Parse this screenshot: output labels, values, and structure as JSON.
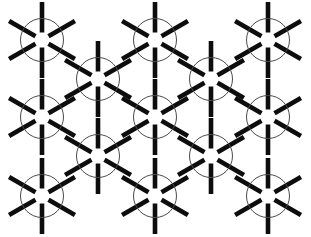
{
  "figure": {
    "type": "line-art-diagram",
    "width": 311,
    "height": 237,
    "background_color": "#ffffff"
  },
  "style": {
    "spoke_color": "#0d0d0d",
    "spoke_width": 4.6,
    "circle_stroke_color": "#4a4a4a",
    "circle_stroke_width": 1.0,
    "circle_radius": 21.5,
    "spoke_inner_radius": 7.5,
    "spoke_outer_radius": 38,
    "spoke_count": 6,
    "spoke_angles_deg": [
      90,
      150,
      210,
      270,
      330,
      30
    ]
  },
  "lattice": {
    "description": "Staggered triangular lattice; odd rows at x offsets 42/155/268, even rows at 98/211",
    "column_spacing": 113,
    "row_spacing": 38.8,
    "row_offset": 56.5,
    "row_count": 5,
    "node_count": 13,
    "nodes": [
      {
        "id": "n1",
        "row": 1,
        "col": 1,
        "cx": 42,
        "cy": 40
      },
      {
        "id": "n2",
        "row": 1,
        "col": 2,
        "cx": 155,
        "cy": 40
      },
      {
        "id": "n3",
        "row": 1,
        "col": 3,
        "cx": 268,
        "cy": 40
      },
      {
        "id": "n4",
        "row": 2,
        "col": 1,
        "cx": 98,
        "cy": 79
      },
      {
        "id": "n5",
        "row": 2,
        "col": 2,
        "cx": 211,
        "cy": 79
      },
      {
        "id": "n6",
        "row": 3,
        "col": 1,
        "cx": 42,
        "cy": 117
      },
      {
        "id": "n7",
        "row": 3,
        "col": 2,
        "cx": 155,
        "cy": 117
      },
      {
        "id": "n8",
        "row": 3,
        "col": 3,
        "cx": 268,
        "cy": 117
      },
      {
        "id": "n9",
        "row": 4,
        "col": 1,
        "cx": 98,
        "cy": 156
      },
      {
        "id": "n10",
        "row": 4,
        "col": 2,
        "cx": 211,
        "cy": 156
      },
      {
        "id": "n11",
        "row": 5,
        "col": 1,
        "cx": 42,
        "cy": 196
      },
      {
        "id": "n12",
        "row": 5,
        "col": 2,
        "cx": 155,
        "cy": 196
      },
      {
        "id": "n13",
        "row": 5,
        "col": 3,
        "cx": 268,
        "cy": 196
      }
    ]
  }
}
